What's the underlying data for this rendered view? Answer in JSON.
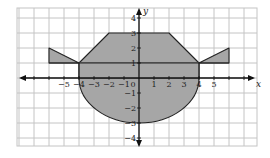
{
  "figure": {
    "type": "coordinate-grid-shaded-region",
    "x_axis_label": "x",
    "y_axis_label": "y",
    "x_tick_labels": [
      "−5",
      "−4",
      "−3",
      "−2",
      "−1",
      "0",
      "1",
      "2",
      "3",
      "4",
      "5"
    ],
    "y_tick_labels": [
      "4",
      "3",
      "2",
      "1",
      "−1",
      "−2",
      "−3",
      "−4"
    ],
    "x_range": [
      -8,
      8
    ],
    "y_range": [
      -4.5,
      4.7
    ],
    "grid_step": 1,
    "colors": {
      "shade": "#a6a6a6",
      "grid": "#c4c4c4",
      "axis": "#111111",
      "outline": "#222222",
      "background": "#ffffff"
    },
    "shapes": [
      {
        "name": "left-wing-triangle",
        "points": [
          [
            -6,
            1
          ],
          [
            -6,
            2
          ],
          [
            -4,
            1
          ]
        ]
      },
      {
        "name": "right-wing-triangle",
        "points": [
          [
            4,
            1
          ],
          [
            6,
            2
          ],
          [
            6,
            1
          ]
        ]
      },
      {
        "name": "upper-trapezoid",
        "points": [
          [
            -4,
            1
          ],
          [
            -2,
            3
          ],
          [
            2,
            3
          ],
          [
            4,
            1
          ]
        ]
      },
      {
        "name": "middle-rectangle",
        "points": [
          [
            -4,
            0
          ],
          [
            4,
            0
          ],
          [
            4,
            1
          ],
          [
            -4,
            1
          ]
        ]
      },
      {
        "name": "lower-semi-ellipse",
        "center": [
          0,
          0
        ],
        "rx": 4,
        "ry": 3
      }
    ]
  }
}
